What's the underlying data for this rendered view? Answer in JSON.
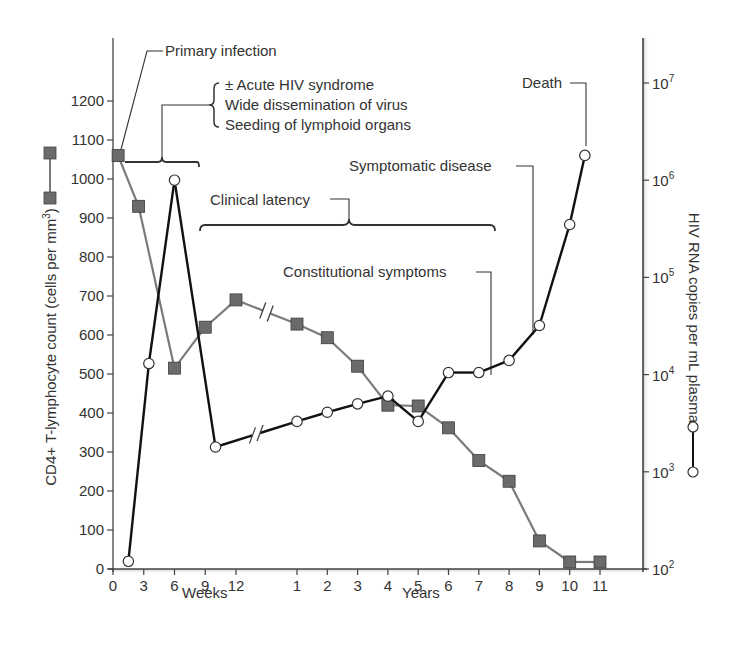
{
  "chart_data": {
    "type": "line",
    "title": "",
    "xlabel_weeks": "Weeks",
    "xlabel_years": "Years",
    "ylabel_left": "CD4+ T-lymphocyte count (cells per mm³)",
    "ylabel_right": "HIV RNA copies per mL plasma",
    "x_ticks_weeks": [
      "0",
      "3",
      "6",
      "9",
      "12"
    ],
    "x_ticks_years": [
      "1",
      "2",
      "3",
      "4",
      "5",
      "6",
      "7",
      "8",
      "9",
      "10",
      "11"
    ],
    "y_left_ticks": [
      "0",
      "100",
      "200",
      "300",
      "400",
      "500",
      "600",
      "700",
      "800",
      "900",
      "1000",
      "1100",
      "1200"
    ],
    "y_left_range": [
      0,
      1200
    ],
    "y_right_ticks": [
      "10²",
      "10³",
      "10⁴",
      "10⁵",
      "10⁶",
      "10⁷"
    ],
    "y_right_range": [
      100,
      10000000
    ],
    "y_right_scale": "log",
    "grid": false,
    "axis_break_between": [
      "12 weeks",
      "1 year"
    ],
    "series": [
      {
        "name": "CD4+ T-lymphocyte count",
        "axis": "left",
        "marker": "square",
        "color": "#7a7a7a",
        "marker_color": "#6b6b6b",
        "x": [
          "0.5 wk",
          "2.5 wk",
          "6 wk",
          "9 wk",
          "12 wk",
          "1 yr",
          "2 yr",
          "3 yr",
          "4 yr",
          "5 yr",
          "6 yr",
          "7 yr",
          "8 yr",
          "9 yr",
          "10 yr",
          "11 yr"
        ],
        "values": [
          1060,
          930,
          515,
          620,
          690,
          628,
          593,
          520,
          420,
          418,
          362,
          278,
          225,
          72,
          18,
          18
        ]
      },
      {
        "name": "HIV RNA copies per mL plasma",
        "axis": "right",
        "marker": "circle-open",
        "color": "#111111",
        "x": [
          "1.5 wk",
          "3.5 wk",
          "6 wk",
          "10 wk",
          "1 yr",
          "2 yr",
          "3 yr",
          "4 yr",
          "5 yr",
          "6 yr",
          "7 yr",
          "8 yr",
          "9 yr",
          "10 yr",
          "10.5 yr"
        ],
        "values": [
          120,
          13000,
          1000000,
          1800,
          3300,
          4100,
          5000,
          6000,
          3300,
          10500,
          10500,
          14000,
          32000,
          350000,
          1800000
        ]
      }
    ],
    "annotations": [
      "Primary infection",
      "± Acute HIV syndrome",
      "Wide dissemination of virus",
      "Seeding of lymphoid organs",
      "Clinical latency",
      "Constitutional symptoms",
      "Symptomatic disease",
      "Death"
    ]
  },
  "labels": {
    "primary_infection": "Primary infection",
    "acute1": "± Acute HIV syndrome",
    "acute2": "Wide dissemination of virus",
    "acute3": "Seeding of lymphoid organs",
    "clinical_latency": "Clinical latency",
    "constitutional": "Constitutional symptoms",
    "symptomatic": "Symptomatic disease",
    "death": "Death",
    "weeks": "Weeks",
    "years": "Years",
    "ylabel_left": "CD4+ T-lymphocyte count (cells per mm",
    "ylabel_left_sup": "3",
    "ylabel_left_end": ")",
    "ylabel_right": "HIV RNA copies per mL plasma"
  }
}
